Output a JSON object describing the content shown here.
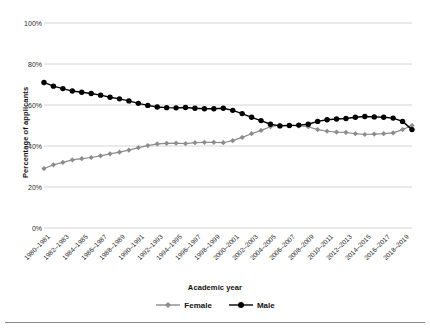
{
  "chart_data": {
    "type": "line",
    "title": "",
    "xlabel": "Academic year",
    "ylabel": "Percentage of applicants",
    "ylim": [
      0,
      100
    ],
    "ytick_labels": [
      "0%",
      "20%",
      "40%",
      "60%",
      "80%",
      "100%"
    ],
    "ytick_values": [
      0,
      20,
      40,
      60,
      80,
      100
    ],
    "grid": "horizontal",
    "legend_position": "bottom",
    "xtick_labels": [
      "1980–1981",
      "1982–1983",
      "1984–1985",
      "1986–1987",
      "1988–1989",
      "1990–1991",
      "1992–1993",
      "1994–1995",
      "1996–1997",
      "1998–1999",
      "2000–2001",
      "2002–2003",
      "2004–2005",
      "2006–2007",
      "2008–2009",
      "2010–2011",
      "2012–2013",
      "2014–2015",
      "2016–2017",
      "2018–2019"
    ],
    "x": [
      "1980–1981",
      "1981–1982",
      "1982–1983",
      "1983–1984",
      "1984–1985",
      "1985–1986",
      "1986–1987",
      "1987–1988",
      "1988–1989",
      "1989–1990",
      "1990–1991",
      "1991–1992",
      "1992–1993",
      "1993–1994",
      "1994–1995",
      "1995–1996",
      "1996–1997",
      "1997–1998",
      "1998–1999",
      "1999–2000",
      "2000–2001",
      "2001–2002",
      "2002–2003",
      "2003–2004",
      "2004–2005",
      "2005–2006",
      "2006–2007",
      "2007–2008",
      "2008–2009",
      "2009–2010",
      "2010–2011",
      "2011–2012",
      "2012–2013",
      "2013–2014",
      "2014–2015",
      "2015–2016",
      "2016–2017",
      "2017–2018",
      "2018–2019",
      "2019–2020"
    ],
    "series": [
      {
        "name": "Female",
        "color": "#8c8c8c",
        "marker": "diamond",
        "values": [
          29.0,
          30.8,
          32.0,
          33.2,
          33.8,
          34.4,
          35.2,
          36.2,
          37.0,
          38.0,
          39.2,
          40.2,
          41.0,
          41.3,
          41.4,
          41.2,
          41.6,
          41.8,
          41.8,
          41.6,
          42.6,
          44.2,
          46.0,
          47.6,
          49.4,
          50.2,
          50.0,
          49.8,
          49.4,
          48.0,
          47.2,
          46.8,
          46.6,
          46.0,
          45.6,
          45.8,
          46.0,
          46.4,
          48.0,
          50.0
        ]
      },
      {
        "name": "Male",
        "color": "#000000",
        "marker": "circle",
        "values": [
          71.0,
          69.2,
          68.0,
          66.8,
          66.2,
          65.6,
          64.8,
          63.8,
          63.0,
          62.0,
          60.8,
          59.8,
          59.0,
          58.7,
          58.6,
          58.8,
          58.4,
          58.2,
          58.2,
          58.4,
          57.4,
          55.8,
          54.0,
          52.4,
          50.6,
          49.8,
          50.0,
          50.2,
          50.6,
          52.0,
          52.8,
          53.2,
          53.4,
          54.0,
          54.4,
          54.2,
          54.0,
          53.6,
          52.0,
          48.0
        ]
      }
    ]
  },
  "legend": {
    "items": [
      {
        "label": "Female",
        "marker": "diamond",
        "color": "#8c8c8c"
      },
      {
        "label": "Male",
        "marker": "circle",
        "color": "#000000"
      }
    ]
  },
  "axes": {
    "y_title": "Percentage of applicants",
    "x_title": "Academic year"
  },
  "colors": {
    "female": "#8c8c8c",
    "male": "#000000",
    "grid": "#d4d4d4",
    "text": "#1a1a1a",
    "rule": "#8a8a8a"
  }
}
